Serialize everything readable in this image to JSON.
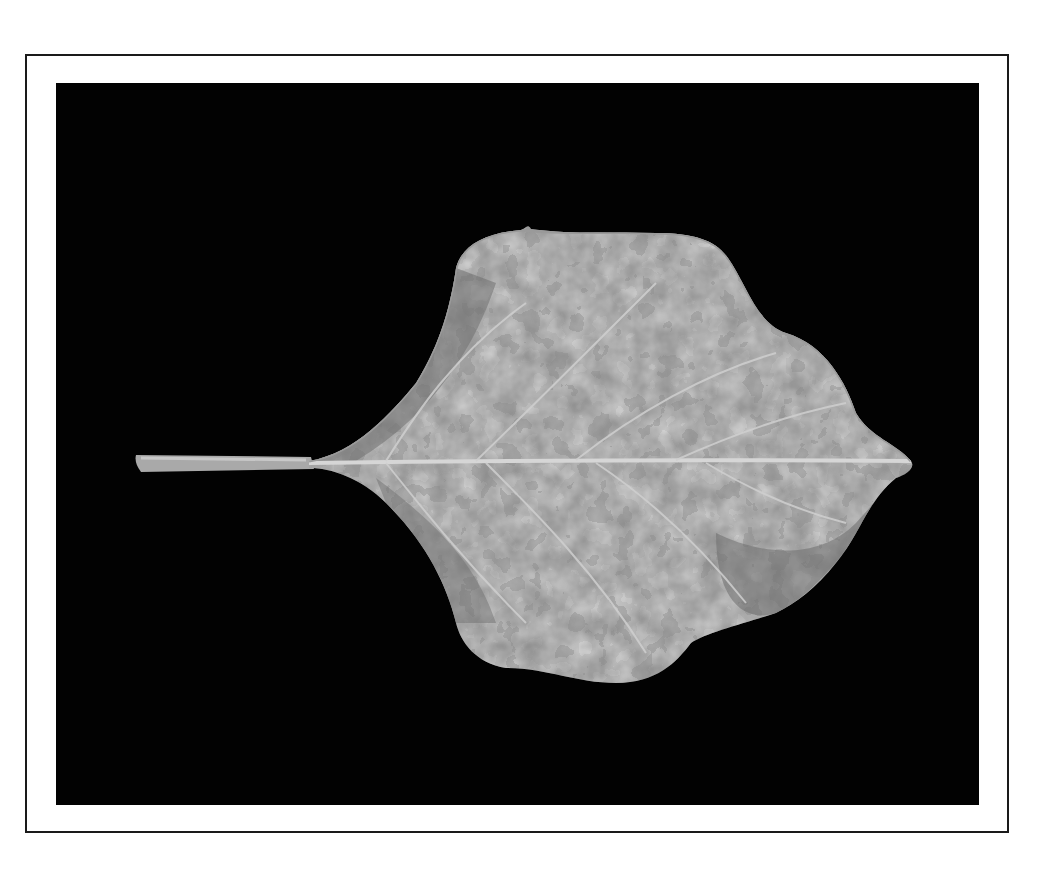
{
  "figure": {
    "background_color": "#020202",
    "frame_color": "#1a1a1a",
    "leaf_light_color": "#b8b8b8",
    "leaf_dark_color": "#6c6c6c",
    "vein_color": "#d4d4d4"
  }
}
